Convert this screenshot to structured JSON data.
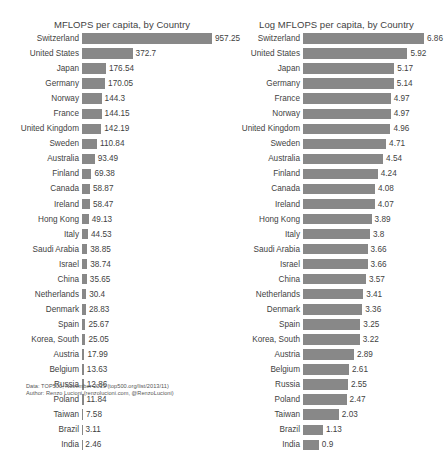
{
  "footer": {
    "data_line": "Data: TOP500, November 2013 (top500.org/list/2013/11)",
    "author_line": "Author: Renzo Lucioni (renzolucioni.com, @RenzoLucioni)"
  },
  "style": {
    "bar_color": "#888888",
    "background": "#ffffff",
    "text_color": "#3f3f3f"
  },
  "chart_data": [
    {
      "type": "bar",
      "orientation": "horizontal",
      "title": "MFLOPS per capita, by Country",
      "xlabel": "",
      "ylabel": "",
      "xlim": [
        0,
        957.25
      ],
      "grid": true,
      "legend": "none",
      "categories": [
        "Switzerland",
        "United States",
        "Japan",
        "Germany",
        "Norway",
        "France",
        "United Kingdom",
        "Sweden",
        "Australia",
        "Finland",
        "Canada",
        "Ireland",
        "Hong Kong",
        "Italy",
        "Saudi Arabia",
        "Israel",
        "China",
        "Netherlands",
        "Denmark",
        "Spain",
        "Korea, South",
        "Austria",
        "Belgium",
        "Russia",
        "Poland",
        "Taiwan",
        "Brazil",
        "India"
      ],
      "values": [
        957.25,
        372.7,
        176.54,
        170.05,
        144.3,
        144.15,
        142.19,
        110.84,
        93.49,
        69.38,
        58.87,
        58.47,
        49.13,
        44.53,
        38.85,
        38.74,
        35.65,
        30.4,
        28.83,
        25.67,
        25.05,
        17.99,
        13.63,
        12.86,
        11.84,
        7.58,
        3.11,
        2.46
      ],
      "labels": [
        "957.25",
        "372.7",
        "176.54",
        "170.05",
        "144.3",
        "144.15",
        "142.19",
        "110.84",
        "93.49",
        "69.38",
        "58.87",
        "58.47",
        "49.13",
        "44.53",
        "38.85",
        "38.74",
        "35.65",
        "30.4",
        "28.83",
        "25.67",
        "25.05",
        "17.99",
        "13.63",
        "12.86",
        "11.84",
        "7.58",
        "3.11",
        "2.46"
      ]
    },
    {
      "type": "bar",
      "orientation": "horizontal",
      "title": "Log MFLOPS per capita, by Country",
      "xlabel": "",
      "ylabel": "",
      "xlim": [
        0,
        6.86
      ],
      "grid": true,
      "legend": "none",
      "categories": [
        "Switzerland",
        "United States",
        "Japan",
        "Germany",
        "France",
        "Norway",
        "United Kingdom",
        "Sweden",
        "Australia",
        "Finland",
        "Canada",
        "Ireland",
        "Hong Kong",
        "Italy",
        "Saudi Arabia",
        "Israel",
        "China",
        "Netherlands",
        "Denmark",
        "Spain",
        "Korea, South",
        "Austria",
        "Belgium",
        "Russia",
        "Poland",
        "Taiwan",
        "Brazil",
        "India"
      ],
      "values": [
        6.86,
        5.92,
        5.17,
        5.14,
        4.97,
        4.97,
        4.96,
        4.71,
        4.54,
        4.24,
        4.08,
        4.07,
        3.89,
        3.8,
        3.66,
        3.66,
        3.57,
        3.41,
        3.36,
        3.25,
        3.22,
        2.89,
        2.61,
        2.55,
        2.47,
        2.03,
        1.13,
        0.9
      ],
      "labels": [
        "6.86",
        "5.92",
        "5.17",
        "5.14",
        "4.97",
        "4.97",
        "4.96",
        "4.71",
        "4.54",
        "4.24",
        "4.08",
        "4.07",
        "3.89",
        "3.8",
        "3.66",
        "3.66",
        "3.57",
        "3.41",
        "3.36",
        "3.25",
        "3.22",
        "2.89",
        "2.61",
        "2.55",
        "2.47",
        "2.03",
        "1.13",
        "0.9"
      ]
    }
  ]
}
